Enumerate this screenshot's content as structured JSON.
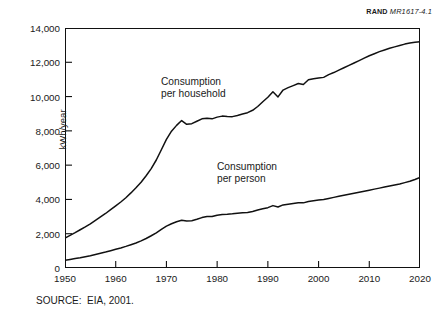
{
  "report_id": {
    "mark": "RAND",
    "number": "MR1617-4.1"
  },
  "source_note": "SOURCE:  EIA, 2001.",
  "annotations": {
    "household": "Consumption\nper household",
    "household_line1": "Consumption",
    "household_line2": "per household",
    "person_line1": "Consumption",
    "person_line2": "per person"
  },
  "chart_data": {
    "type": "line",
    "title": "",
    "subtitle": "",
    "xlabel": "",
    "ylabel": "kWh/year",
    "xlim": [
      1950,
      2020
    ],
    "ylim": [
      0,
      14000
    ],
    "xticks": [
      1950,
      1960,
      1970,
      1980,
      1990,
      2000,
      2010,
      2020
    ],
    "xtick_labels": [
      "1950",
      "1960",
      "1970",
      "1980",
      "1990",
      "2000",
      "2010",
      "2020"
    ],
    "yticks": [
      0,
      2000,
      4000,
      6000,
      8000,
      10000,
      12000,
      14000
    ],
    "ytick_labels": [
      "0",
      "2,000",
      "4,000",
      "6,000",
      "8,000",
      "10,000",
      "12,000",
      "14,000"
    ],
    "grid": false,
    "legend": "inline-annotations",
    "line_color": "#111111",
    "series": [
      {
        "name": "Consumption per household",
        "x": [
          1950,
          1951,
          1952,
          1953,
          1954,
          1955,
          1956,
          1957,
          1958,
          1959,
          1960,
          1961,
          1962,
          1963,
          1964,
          1965,
          1966,
          1967,
          1968,
          1969,
          1970,
          1971,
          1972,
          1973,
          1974,
          1975,
          1976,
          1977,
          1978,
          1979,
          1980,
          1981,
          1982,
          1983,
          1984,
          1985,
          1986,
          1987,
          1988,
          1989,
          1990,
          1991,
          1992,
          1993,
          1994,
          1995,
          1996,
          1997,
          1998,
          1999,
          2000,
          2001,
          2002,
          2003,
          2004,
          2005,
          2006,
          2007,
          2008,
          2009,
          2010,
          2011,
          2012,
          2013,
          2014,
          2015,
          2016,
          2017,
          2018,
          2019,
          2020
        ],
        "values": [
          1750,
          1900,
          2060,
          2230,
          2400,
          2580,
          2780,
          2980,
          3180,
          3400,
          3620,
          3850,
          4100,
          4380,
          4680,
          5000,
          5380,
          5800,
          6300,
          6900,
          7500,
          7980,
          8320,
          8600,
          8380,
          8420,
          8560,
          8700,
          8740,
          8700,
          8800,
          8860,
          8840,
          8830,
          8900,
          8980,
          9060,
          9200,
          9420,
          9700,
          9960,
          10280,
          9980,
          10380,
          10520,
          10640,
          10760,
          10700,
          10980,
          11040,
          11080,
          11120,
          11280,
          11400,
          11540,
          11680,
          11820,
          11960,
          12100,
          12240,
          12380,
          12500,
          12620,
          12720,
          12820,
          12900,
          12980,
          13060,
          13120,
          13170,
          13200
        ]
      },
      {
        "name": "Consumption per person",
        "x": [
          1950,
          1951,
          1952,
          1953,
          1954,
          1955,
          1956,
          1957,
          1958,
          1959,
          1960,
          1961,
          1962,
          1963,
          1964,
          1965,
          1966,
          1967,
          1968,
          1969,
          1970,
          1971,
          1972,
          1973,
          1974,
          1975,
          1976,
          1977,
          1978,
          1979,
          1980,
          1981,
          1982,
          1983,
          1984,
          1985,
          1986,
          1987,
          1988,
          1989,
          1990,
          1991,
          1992,
          1993,
          1994,
          1995,
          1996,
          1997,
          1998,
          1999,
          2000,
          2001,
          2002,
          2003,
          2004,
          2005,
          2006,
          2007,
          2008,
          2009,
          2010,
          2011,
          2012,
          2013,
          2014,
          2015,
          2016,
          2017,
          2018,
          2019,
          2020
        ],
        "values": [
          450,
          500,
          550,
          600,
          660,
          720,
          790,
          860,
          930,
          1010,
          1090,
          1170,
          1260,
          1360,
          1460,
          1580,
          1720,
          1880,
          2050,
          2250,
          2440,
          2580,
          2700,
          2780,
          2740,
          2760,
          2840,
          2940,
          3000,
          3000,
          3080,
          3120,
          3130,
          3160,
          3200,
          3220,
          3240,
          3300,
          3380,
          3460,
          3520,
          3640,
          3560,
          3680,
          3720,
          3760,
          3800,
          3800,
          3880,
          3920,
          3960,
          4000,
          4060,
          4120,
          4180,
          4240,
          4300,
          4360,
          4420,
          4480,
          4540,
          4600,
          4660,
          4720,
          4780,
          4840,
          4900,
          4980,
          5060,
          5160,
          5280
        ]
      }
    ]
  }
}
